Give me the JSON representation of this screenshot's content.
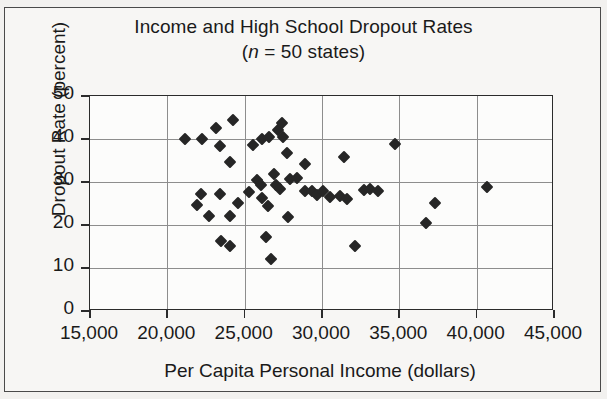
{
  "figure": {
    "background_color": "#f2f1ef",
    "plot_background_color": "#fcfcfb",
    "frame_color": "#4a4a4a",
    "marker_color": "#262626",
    "grid_color": "#8d8d8d"
  },
  "chart_data": {
    "type": "scatter",
    "title": "Income and High School Dropout Rates",
    "subtitle_prefix": "(",
    "subtitle_italic": "n",
    "subtitle_rest": " = 50 states)",
    "subtitle_full": "(n = 50 states)",
    "xlabel": "Per Capita Personal Income (dollars)",
    "ylabel": "Dropout Rate (percent)",
    "xlim": [
      15000,
      45000
    ],
    "ylim": [
      0,
      50
    ],
    "xticks": [
      15000,
      20000,
      25000,
      30000,
      35000,
      40000,
      45000
    ],
    "xtick_labels": [
      "15,000",
      "20,000",
      "25,000",
      "30,000",
      "35,000",
      "40,000",
      "45,000"
    ],
    "yticks": [
      0,
      10,
      20,
      30,
      40,
      50
    ],
    "ytick_labels": [
      "0",
      "10",
      "20",
      "30",
      "40",
      "50"
    ],
    "grid": true,
    "legend": null,
    "n_points": 50,
    "marker": "diamond",
    "points": [
      {
        "x": 21150,
        "y": 40.0
      },
      {
        "x": 22250,
        "y": 40.0
      },
      {
        "x": 23150,
        "y": 42.5
      },
      {
        "x": 23400,
        "y": 38.3
      },
      {
        "x": 24250,
        "y": 44.4
      },
      {
        "x": 24050,
        "y": 34.7
      },
      {
        "x": 25550,
        "y": 38.7
      },
      {
        "x": 26100,
        "y": 40.0
      },
      {
        "x": 26600,
        "y": 40.4
      },
      {
        "x": 27150,
        "y": 42.2
      },
      {
        "x": 27400,
        "y": 43.8
      },
      {
        "x": 27500,
        "y": 40.4
      },
      {
        "x": 27750,
        "y": 36.8
      },
      {
        "x": 28900,
        "y": 34.2
      },
      {
        "x": 31400,
        "y": 35.9
      },
      {
        "x": 34700,
        "y": 38.9
      },
      {
        "x": 22150,
        "y": 27.2
      },
      {
        "x": 21950,
        "y": 24.6
      },
      {
        "x": 22700,
        "y": 22.2
      },
      {
        "x": 23400,
        "y": 27.1
      },
      {
        "x": 24050,
        "y": 22.0
      },
      {
        "x": 24600,
        "y": 25.1
      },
      {
        "x": 25250,
        "y": 27.7
      },
      {
        "x": 25800,
        "y": 30.5
      },
      {
        "x": 26050,
        "y": 29.4
      },
      {
        "x": 26150,
        "y": 26.2
      },
      {
        "x": 26500,
        "y": 24.5
      },
      {
        "x": 26900,
        "y": 31.8
      },
      {
        "x": 27050,
        "y": 29.2
      },
      {
        "x": 27300,
        "y": 28.4
      },
      {
        "x": 27800,
        "y": 21.8
      },
      {
        "x": 27950,
        "y": 30.6
      },
      {
        "x": 28400,
        "y": 30.9
      },
      {
        "x": 28900,
        "y": 27.9
      },
      {
        "x": 29350,
        "y": 27.9
      },
      {
        "x": 29700,
        "y": 26.9
      },
      {
        "x": 30050,
        "y": 27.8
      },
      {
        "x": 30500,
        "y": 26.4
      },
      {
        "x": 31150,
        "y": 26.7
      },
      {
        "x": 31600,
        "y": 26.1
      },
      {
        "x": 32700,
        "y": 28.2
      },
      {
        "x": 33100,
        "y": 28.4
      },
      {
        "x": 33600,
        "y": 27.9
      },
      {
        "x": 37300,
        "y": 25.2
      },
      {
        "x": 40700,
        "y": 28.9
      },
      {
        "x": 36700,
        "y": 20.5
      },
      {
        "x": 23500,
        "y": 16.2
      },
      {
        "x": 24050,
        "y": 15.2
      },
      {
        "x": 26400,
        "y": 17.2
      },
      {
        "x": 26700,
        "y": 12.0
      },
      {
        "x": 32150,
        "y": 15.2
      }
    ]
  }
}
